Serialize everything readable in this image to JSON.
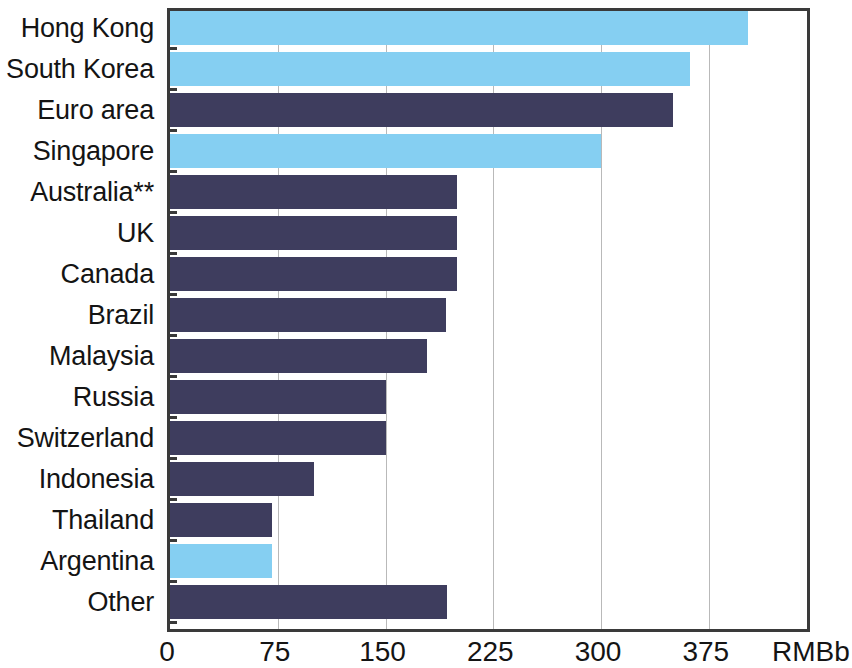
{
  "chart_data": {
    "type": "bar",
    "orientation": "horizontal",
    "title": "",
    "xlabel": "RMBb",
    "ylabel": "",
    "xlim": [
      0,
      450
    ],
    "xticks": [
      0,
      75,
      150,
      225,
      300,
      375
    ],
    "xtick_labels": [
      "0",
      "75",
      "150",
      "225",
      "300",
      "375"
    ],
    "unit_label": "RMBb",
    "grid": true,
    "legend": null,
    "categories": [
      "Hong Kong",
      "South Korea",
      "Euro area",
      "Singapore",
      "Australia**",
      "UK",
      "Canada",
      "Brazil",
      "Malaysia",
      "Russia",
      "Switzerland",
      "Indonesia",
      "Thailand",
      "Argentina",
      "Other"
    ],
    "values": [
      402,
      362,
      350,
      300,
      200,
      200,
      200,
      192,
      179,
      150,
      150,
      100,
      71,
      71,
      193
    ],
    "bar_colors": [
      "#85CFF2",
      "#85CFF2",
      "#3E3D5E",
      "#85CFF2",
      "#3E3D5E",
      "#3E3D5E",
      "#3E3D5E",
      "#3E3D5E",
      "#3E3D5E",
      "#3E3D5E",
      "#3E3D5E",
      "#3E3D5E",
      "#3E3D5E",
      "#85CFF2",
      "#3E3D5E"
    ],
    "color_light_blue": "#85CFF2",
    "color_dark_navy": "#3E3D5E",
    "axis_color": "#3A3A3A",
    "gridline_color": "#B9B9B9"
  }
}
